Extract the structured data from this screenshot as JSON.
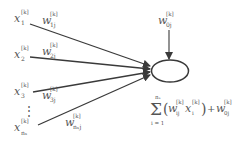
{
  "diagram": {
    "inputs": [
      {
        "label": "x",
        "sub": "1",
        "sup": "[k]"
      },
      {
        "label": "x",
        "sub": "2",
        "sup": "[k]"
      },
      {
        "label": "x",
        "sub": "3",
        "sup": "[k]"
      },
      {
        "label": "x",
        "sub": "nₓ",
        "sup": "[k]"
      }
    ],
    "ellipsis": "⋮",
    "weights": [
      {
        "label": "w",
        "sub": "1j",
        "sup": "[k]"
      },
      {
        "label": "w",
        "sub": "2j",
        "sup": "[k]"
      },
      {
        "label": "w",
        "sub": "3j",
        "sup": "[k]"
      },
      {
        "label": "w",
        "sub": "nₓj",
        "sup": "[k]"
      }
    ],
    "bias": {
      "label": "w",
      "sub": "0j",
      "sup": "[k]"
    },
    "formula": {
      "sum_symbol": "Σ",
      "upper": "nₓ",
      "lower": "i = 1",
      "term_open": "(",
      "w": "w",
      "w_sub": "ij",
      "w_sup": "[k]",
      "x": "x",
      "x_sub": "i",
      "x_sup": "[k]",
      "term_close": ")",
      "plus": "+",
      "b": "w",
      "b_sub": "0j",
      "b_sup": "[k]"
    },
    "colors": {
      "line": "#3a3a3a",
      "text": "#555555",
      "background": "#ffffff"
    }
  }
}
